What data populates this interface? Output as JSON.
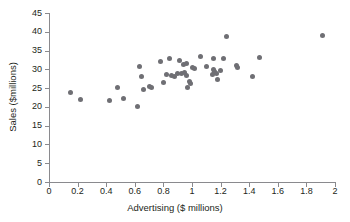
{
  "chart_data": {
    "type": "scatter",
    "title": "",
    "xlabel": "Advertising ($ millions)",
    "ylabel": "Sales ($millions)",
    "xlim": [
      0,
      2
    ],
    "ylim": [
      0,
      45
    ],
    "xticks": [
      0,
      0.2,
      0.4,
      0.6,
      0.8,
      1,
      1.2,
      1.4,
      1.6,
      1.8,
      2
    ],
    "xtick_labels": [
      "0",
      "0.2",
      "0.4",
      "0.6",
      "0.8",
      "1",
      "1.2",
      "1.4",
      "1.6",
      "1.8",
      "2"
    ],
    "yticks": [
      0,
      5,
      10,
      15,
      20,
      25,
      30,
      35,
      40,
      45
    ],
    "ytick_labels": [
      "0",
      "5",
      "10",
      "15",
      "20",
      "25",
      "30",
      "35",
      "40",
      "45"
    ],
    "grid": false,
    "legend": false,
    "marker_color": "#6f6f74",
    "axis_color": "#8a8a8e",
    "background_color": "#ffffff",
    "points": [
      [
        0.15,
        23.7
      ],
      [
        0.22,
        22.0
      ],
      [
        0.42,
        21.8
      ],
      [
        0.48,
        25.1
      ],
      [
        0.52,
        22.2
      ],
      [
        0.62,
        20.1
      ],
      [
        0.63,
        30.7
      ],
      [
        0.65,
        28.2
      ],
      [
        0.66,
        24.6
      ],
      [
        0.7,
        25.4
      ],
      [
        0.72,
        25.2
      ],
      [
        0.78,
        32.1
      ],
      [
        0.8,
        26.5
      ],
      [
        0.82,
        28.7
      ],
      [
        0.84,
        33.0
      ],
      [
        0.86,
        28.4
      ],
      [
        0.88,
        28.0
      ],
      [
        0.9,
        28.8
      ],
      [
        0.91,
        32.4
      ],
      [
        0.93,
        28.9
      ],
      [
        0.94,
        31.3
      ],
      [
        0.95,
        29.1
      ],
      [
        0.96,
        31.6
      ],
      [
        0.96,
        28.3
      ],
      [
        0.97,
        25.1
      ],
      [
        0.98,
        26.7
      ],
      [
        0.99,
        26.2
      ],
      [
        1.0,
        30.6
      ],
      [
        1.02,
        30.3
      ],
      [
        1.06,
        33.5
      ],
      [
        1.1,
        30.8
      ],
      [
        1.15,
        33.0
      ],
      [
        1.14,
        28.5
      ],
      [
        1.15,
        29.9
      ],
      [
        1.16,
        29.4
      ],
      [
        1.17,
        28.9
      ],
      [
        1.18,
        27.2
      ],
      [
        1.2,
        29.6
      ],
      [
        1.22,
        33.0
      ],
      [
        1.24,
        38.7
      ],
      [
        1.31,
        31.0
      ],
      [
        1.32,
        30.6
      ],
      [
        1.42,
        28.0
      ],
      [
        1.47,
        33.2
      ],
      [
        1.91,
        39.0
      ]
    ]
  }
}
